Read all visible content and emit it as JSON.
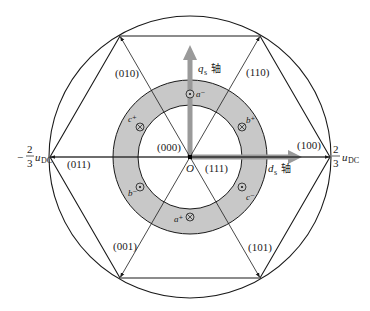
{
  "diagram": {
    "type": "space-vector-hexagon",
    "colors": {
      "line": "#1a1a1a",
      "ring_fill": "#c8c8c8",
      "axis_arrow": "#9a9a9a",
      "background": "#ffffff"
    },
    "origin_label": "O",
    "zero_vectors": {
      "v000": "(000)",
      "v111": "(111)"
    },
    "active_vectors": [
      {
        "label": "(100)",
        "angle_deg": 0
      },
      {
        "label": "(110)",
        "angle_deg": 60
      },
      {
        "label": "(010)",
        "angle_deg": 120
      },
      {
        "label": "(011)",
        "angle_deg": 180
      },
      {
        "label": "(001)",
        "angle_deg": 240
      },
      {
        "label": "(101)",
        "angle_deg": 300
      }
    ],
    "axes": {
      "d_axis": {
        "symbol": "d",
        "subscript": "s",
        "suffix": "轴"
      },
      "q_axis": {
        "symbol": "q",
        "subscript": "s",
        "suffix": "轴"
      }
    },
    "magnitude_labels": {
      "right": {
        "sign": "",
        "numerator": "2",
        "denominator": "3",
        "var": "u",
        "var_sub": "DC"
      },
      "left": {
        "sign": "−",
        "numerator": "2",
        "denominator": "3",
        "var": "u",
        "var_sub": "DC"
      }
    },
    "windings": [
      {
        "name": "a",
        "sign": "−",
        "symbol": "dot",
        "label": "a⁻"
      },
      {
        "name": "a",
        "sign": "+",
        "symbol": "cross",
        "label": "a⁺"
      },
      {
        "name": "b",
        "sign": "+",
        "symbol": "cross",
        "label": "b⁺"
      },
      {
        "name": "b",
        "sign": "−",
        "symbol": "dot",
        "label": "b⁻"
      },
      {
        "name": "c",
        "sign": "+",
        "symbol": "cross",
        "label": "c⁺"
      },
      {
        "name": "c",
        "sign": "−",
        "symbol": "dot",
        "label": "c⁻"
      }
    ]
  }
}
